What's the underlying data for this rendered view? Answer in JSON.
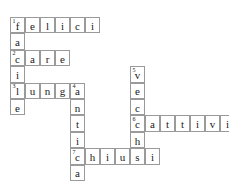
{
  "puzzle": {
    "title": "crossword-grid",
    "cell_width": 15,
    "cell_height": 16.4,
    "origin_x": 10,
    "origin_y": 17,
    "border_color": "#9a9a9a",
    "letter_color": "#1a1a1a",
    "background": "#ffffff",
    "entries": [
      {
        "number": "1",
        "direction": "across",
        "answer": "felici",
        "row": 0,
        "col": 0
      },
      {
        "number": "1",
        "direction": "down",
        "answer": "facile",
        "row": 0,
        "col": 0
      },
      {
        "number": "2",
        "direction": "across",
        "answer": "care",
        "row": 2,
        "col": 0
      },
      {
        "number": "3",
        "direction": "across",
        "answer": "lunga",
        "row": 4,
        "col": 0
      },
      {
        "number": "4",
        "direction": "down",
        "answer": "antica",
        "row": 4,
        "col": 4
      },
      {
        "number": "5",
        "direction": "down",
        "answer": "vecchi",
        "row": 3,
        "col": 8
      },
      {
        "number": "6",
        "direction": "across",
        "answer": "cattivi",
        "row": 6,
        "col": 8
      },
      {
        "number": "7",
        "direction": "across",
        "answer": "chiusi",
        "row": 8,
        "col": 4
      }
    ],
    "cells": [
      {
        "row": 0,
        "col": 0,
        "letter": "f",
        "number": "1"
      },
      {
        "row": 0,
        "col": 1,
        "letter": "e",
        "number": ""
      },
      {
        "row": 0,
        "col": 2,
        "letter": "l",
        "number": ""
      },
      {
        "row": 0,
        "col": 3,
        "letter": "i",
        "number": ""
      },
      {
        "row": 0,
        "col": 4,
        "letter": "c",
        "number": ""
      },
      {
        "row": 0,
        "col": 5,
        "letter": "i",
        "number": ""
      },
      {
        "row": 1,
        "col": 0,
        "letter": "a",
        "number": ""
      },
      {
        "row": 2,
        "col": 0,
        "letter": "c",
        "number": "2"
      },
      {
        "row": 2,
        "col": 1,
        "letter": "a",
        "number": ""
      },
      {
        "row": 2,
        "col": 2,
        "letter": "r",
        "number": ""
      },
      {
        "row": 2,
        "col": 3,
        "letter": "e",
        "number": ""
      },
      {
        "row": 3,
        "col": 0,
        "letter": "i",
        "number": ""
      },
      {
        "row": 3,
        "col": 8,
        "letter": "v",
        "number": "5"
      },
      {
        "row": 4,
        "col": 0,
        "letter": "l",
        "number": "3"
      },
      {
        "row": 4,
        "col": 1,
        "letter": "u",
        "number": ""
      },
      {
        "row": 4,
        "col": 2,
        "letter": "n",
        "number": ""
      },
      {
        "row": 4,
        "col": 3,
        "letter": "g",
        "number": ""
      },
      {
        "row": 4,
        "col": 4,
        "letter": "a",
        "number": "4"
      },
      {
        "row": 4,
        "col": 8,
        "letter": "e",
        "number": ""
      },
      {
        "row": 5,
        "col": 0,
        "letter": "e",
        "number": ""
      },
      {
        "row": 5,
        "col": 4,
        "letter": "n",
        "number": ""
      },
      {
        "row": 5,
        "col": 8,
        "letter": "c",
        "number": ""
      },
      {
        "row": 6,
        "col": 4,
        "letter": "t",
        "number": ""
      },
      {
        "row": 6,
        "col": 8,
        "letter": "c",
        "number": "6"
      },
      {
        "row": 6,
        "col": 9,
        "letter": "a",
        "number": ""
      },
      {
        "row": 6,
        "col": 10,
        "letter": "t",
        "number": ""
      },
      {
        "row": 6,
        "col": 11,
        "letter": "t",
        "number": ""
      },
      {
        "row": 6,
        "col": 12,
        "letter": "i",
        "number": ""
      },
      {
        "row": 6,
        "col": 13,
        "letter": "v",
        "number": ""
      },
      {
        "row": 6,
        "col": 14,
        "letter": "i",
        "number": ""
      },
      {
        "row": 7,
        "col": 4,
        "letter": "i",
        "number": ""
      },
      {
        "row": 7,
        "col": 8,
        "letter": "h",
        "number": ""
      },
      {
        "row": 8,
        "col": 4,
        "letter": "c",
        "number": "7"
      },
      {
        "row": 8,
        "col": 5,
        "letter": "h",
        "number": ""
      },
      {
        "row": 8,
        "col": 6,
        "letter": "i",
        "number": ""
      },
      {
        "row": 8,
        "col": 7,
        "letter": "u",
        "number": ""
      },
      {
        "row": 8,
        "col": 8,
        "letter": "s",
        "number": ""
      },
      {
        "row": 8,
        "col": 9,
        "letter": "i",
        "number": ""
      },
      {
        "row": 9,
        "col": 4,
        "letter": "a",
        "number": ""
      }
    ]
  }
}
